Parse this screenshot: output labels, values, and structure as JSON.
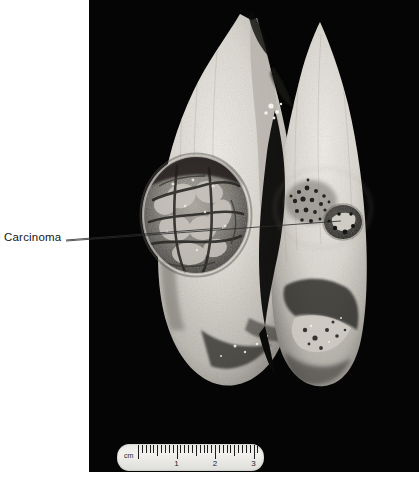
{
  "figure": {
    "kind": "gross-pathology-photograph",
    "background_color": "#ffffff",
    "plate_color": "#050505",
    "width": 419,
    "height": 487
  },
  "annotations": [
    {
      "id": "carcinoma",
      "label": "Carcinoma",
      "text_color": "#161616",
      "leader_lines": 2,
      "points_to": [
        "left-lobe-tumor",
        "right-lobe-tumor"
      ]
    }
  ],
  "specimen": {
    "description": "Bisected lung specimen, cut surface facing viewer, two lobes separated by a dark central cleft",
    "tissue_color_light": "#e4e1dc",
    "tissue_color_mid": "#c2beb7",
    "tissue_color_shadow": "#8d8982",
    "lesions": [
      {
        "id": "left-lobe-tumor",
        "label": "Carcinoma",
        "appearance": "large rounded variegated nodular mass with necrotic and hemorrhagic areas",
        "color_dark": "#2c2a27",
        "color_mid": "#6e6a63",
        "color_light": "#c8c4bd"
      },
      {
        "id": "right-lobe-tumor",
        "label": "Carcinoma",
        "appearance": "speckled anthracotic tumor focus with adjacent darker nodule",
        "color_dark": "#1f1e1c",
        "color_mid": "#5d5a54",
        "color_light": "#bdb9b2"
      }
    ]
  },
  "scale_bar": {
    "name": "ruler",
    "unit_label": "cm",
    "numbers": [
      "1",
      "2",
      "3"
    ],
    "total_cm": 3.4,
    "body_color": "#ecebe8",
    "tick_color": "#1d1d1d"
  }
}
